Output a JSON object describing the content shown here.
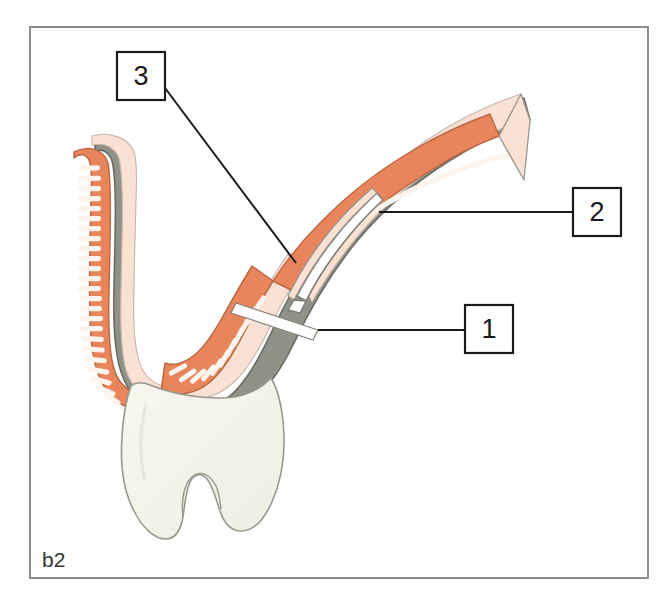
{
  "figure": {
    "panel_caption": "b2",
    "frame": {
      "x": 30,
      "y": 27,
      "width": 618,
      "height": 551,
      "stroke_color": "#8d8d8d"
    },
    "background_color": "#ffffff"
  },
  "callouts": [
    {
      "id": "callout-1",
      "label": "1",
      "box": {
        "x": 465,
        "y": 305,
        "width": 48,
        "height": 48
      },
      "leader": {
        "from_x": 465,
        "from_y": 330,
        "to_x": 318,
        "to_y": 330
      },
      "target": "inner-bend-incision-gap"
    },
    {
      "id": "callout-2",
      "label": "2",
      "box": {
        "x": 573,
        "y": 188,
        "width": 48,
        "height": 48
      },
      "leader": {
        "from_x": 573,
        "from_y": 212,
        "to_x": 379,
        "to_y": 212
      },
      "target": "submucosal-flap-dissection"
    },
    {
      "id": "callout-3",
      "label": "3",
      "box": {
        "x": 117,
        "y": 52,
        "width": 48,
        "height": 48
      },
      "leader": {
        "from_x": 165,
        "from_y": 88,
        "to_x": 296,
        "to_y": 263
      },
      "target": "serosa-outer-layer"
    }
  ],
  "anatomy": {
    "name": "hollow-viscus-cross-section",
    "layers": [
      {
        "name": "serosa-outer-membrane",
        "color": "#8e9289",
        "description": "gray-green outer serosal coat"
      },
      {
        "name": "muscularis-submucosa",
        "color": "#f9e1d4",
        "description": "pale peach middle wall layer"
      },
      {
        "name": "mucosa-villi",
        "color": "#e8855c",
        "description": "orange mucosal lining with comb-like villi"
      },
      {
        "name": "blind-pouch-bulb",
        "color": "#f4f4ec",
        "description": "pale cream bulbous blind ending pouch"
      }
    ],
    "villi_count_left": 26,
    "villi_count_right": 22,
    "villi_count_bend": 11,
    "outline_color": "#6e6a63",
    "mucosa_outline_color": "#b96a45"
  }
}
